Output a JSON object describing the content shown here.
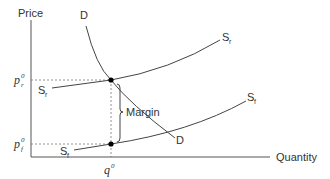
{
  "diagram": {
    "type": "supply-demand",
    "axes": {
      "y_label": "Price",
      "x_label": "Quantity"
    },
    "price_levels": [
      {
        "base": "p",
        "sub": "r",
        "sup": "0"
      },
      {
        "base": "p",
        "sub": "f",
        "sup": "0"
      }
    ],
    "quantity_level": {
      "base": "q",
      "sup": "0"
    },
    "curves": {
      "demand": {
        "label": "D",
        "label_end": "D"
      },
      "supply_retail": {
        "label": "S",
        "sub": "r"
      },
      "supply_farm": {
        "label": "S",
        "sub": "f"
      }
    },
    "annotation": {
      "margin_label": "Margin"
    },
    "colors": {
      "line": "#444444",
      "text": "#333333",
      "dashed": "#666666",
      "dot": "#000000"
    }
  }
}
